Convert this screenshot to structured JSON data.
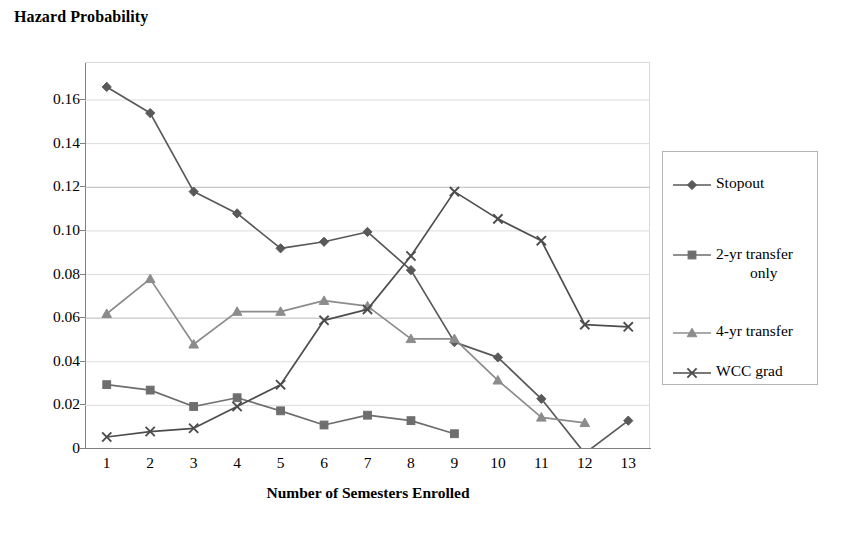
{
  "chart_data": {
    "type": "line",
    "title": "Hazard Probability",
    "xlabel": "Number of Semesters Enrolled",
    "ylabel": "",
    "x": [
      1,
      2,
      3,
      4,
      5,
      6,
      7,
      8,
      9,
      10,
      11,
      12,
      13
    ],
    "categories": [
      "1",
      "2",
      "3",
      "4",
      "5",
      "6",
      "7",
      "8",
      "9",
      "10",
      "11",
      "12",
      "13"
    ],
    "ytick_labels": [
      "0",
      "0.02",
      "0.04",
      "0.06",
      "0.08",
      "0.10",
      "0.12",
      "0.14",
      "0.16"
    ],
    "ytick_values": [
      0,
      0.02,
      0.04,
      0.06,
      0.08,
      0.1,
      0.12,
      0.14,
      0.16
    ],
    "ylim": [
      -0.004,
      0.178
    ],
    "xlim": [
      0.5,
      13.5
    ],
    "grid": "horizontal",
    "legend_position": "right-outside",
    "series": [
      {
        "name": "Stopout",
        "marker": "diamond",
        "color": "#595959",
        "x": [
          1,
          2,
          3,
          4,
          5,
          6,
          7,
          8,
          9,
          10,
          11,
          12,
          13
        ],
        "values": [
          0.166,
          0.154,
          0.118,
          0.108,
          0.092,
          0.095,
          0.0995,
          0.082,
          0.049,
          0.042,
          0.023,
          -0.002,
          0.013
        ]
      },
      {
        "name": "2-yr transfer only",
        "marker": "square",
        "color": "#6e6e6e",
        "x": [
          1,
          2,
          3,
          4,
          5,
          6,
          7,
          8,
          9
        ],
        "values": [
          0.0295,
          0.027,
          0.0195,
          0.0235,
          0.0175,
          0.011,
          0.0155,
          0.013,
          0.007
        ]
      },
      {
        "name": "4-yr transfer",
        "marker": "triangle",
        "color": "#8c8c8c",
        "x": [
          1,
          2,
          3,
          4,
          5,
          6,
          7,
          8,
          9,
          10,
          11,
          12
        ],
        "values": [
          0.062,
          0.078,
          0.048,
          0.063,
          0.063,
          0.068,
          0.0655,
          0.0505,
          0.0505,
          0.0315,
          0.0145,
          0.012
        ]
      },
      {
        "name": "WCC grad",
        "marker": "cross",
        "color": "#4d4d4d",
        "x": [
          1,
          2,
          3,
          4,
          5,
          6,
          7,
          8,
          9,
          10,
          11,
          12,
          13
        ],
        "values": [
          0.0055,
          0.008,
          0.0095,
          0.0195,
          0.0295,
          0.059,
          0.064,
          0.0885,
          0.118,
          0.1055,
          0.0955,
          0.057,
          0.056
        ]
      }
    ]
  },
  "legend": {
    "items": [
      {
        "label": "Stopout",
        "marker": "diamond",
        "line1": "Stopout",
        "line2": ""
      },
      {
        "label": "2-yr transfer only",
        "marker": "square",
        "line1": "2-yr transfer",
        "line2": "only"
      },
      {
        "label": "4-yr transfer",
        "marker": "triangle",
        "line1": "4-yr transfer",
        "line2": ""
      },
      {
        "label": "WCC grad",
        "marker": "cross",
        "line1": "WCC grad",
        "line2": ""
      }
    ]
  },
  "colors": {
    "axis": "#808080",
    "grid": "#d9d9d9",
    "text": "#000000",
    "background": "#ffffff"
  }
}
